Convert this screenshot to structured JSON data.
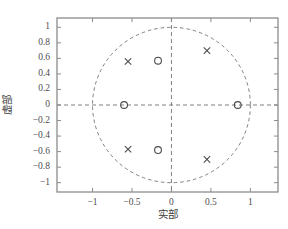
{
  "chart_data": {
    "type": "scatter",
    "title": "",
    "xlabel": "实部",
    "ylabel": "虚部",
    "xlim": [
      -1.45,
      1.35
    ],
    "ylim": [
      -1.12,
      1.12
    ],
    "xticks": [
      -1,
      -0.5,
      0,
      0.5,
      1
    ],
    "xticklabels": [
      "−1",
      "−0.5",
      "0",
      "0.5",
      "1"
    ],
    "yticks": [
      1,
      0.8,
      0.6,
      0.4,
      0.2,
      0,
      -0.2,
      -0.4,
      -0.6,
      -0.8,
      -1
    ],
    "yticklabels": [
      "1",
      "0.8",
      "0.6",
      "0.4",
      "0.2",
      "0",
      "−0.2",
      "−0.4",
      "−0.6",
      "−0.8",
      "−1"
    ],
    "grid": false,
    "legend": "none",
    "unit_circle": {
      "radius": 1,
      "center": [
        0,
        0
      ],
      "style": "dashed",
      "color": "#808080"
    },
    "axis_lines": {
      "style": "dashed",
      "color": "#808080"
    },
    "series": [
      {
        "name": "零点",
        "marker": "circle",
        "color": "#4a4a4a",
        "points": [
          {
            "x": -0.6,
            "y": 0.0
          },
          {
            "x": -0.17,
            "y": 0.57
          },
          {
            "x": -0.17,
            "y": -0.58
          },
          {
            "x": 0.84,
            "y": 0.0
          }
        ]
      },
      {
        "name": "极点",
        "marker": "cross",
        "color": "#4a4a4a",
        "points": [
          {
            "x": -0.55,
            "y": 0.56
          },
          {
            "x": -0.55,
            "y": -0.57
          },
          {
            "x": 0.45,
            "y": 0.7
          },
          {
            "x": 0.45,
            "y": -0.7
          }
        ]
      }
    ]
  },
  "axes": {
    "frame_color": "#8c8c8c",
    "background": "#ffffff"
  }
}
